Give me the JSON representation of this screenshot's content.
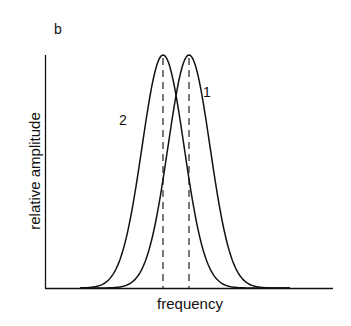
{
  "panel_label": "b",
  "chart_data": {
    "type": "line",
    "title": "",
    "xlabel": "frequency",
    "ylabel": "relative amplitude",
    "grid": false,
    "legend": "inline curve labels",
    "x_ticks": [],
    "y_ticks": [],
    "series": [
      {
        "name": "1",
        "shape": "gaussian",
        "center": 0.5,
        "peak": 1.0,
        "width_sigma": 0.073
      },
      {
        "name": "2",
        "shape": "gaussian",
        "center": 0.41,
        "peak": 1.0,
        "width_sigma": 0.073
      }
    ],
    "markers": [
      {
        "type": "dashed-vertical",
        "x": 0.41,
        "series": "2"
      },
      {
        "type": "dashed-vertical",
        "x": 0.5,
        "series": "1"
      }
    ],
    "annotations": [
      {
        "text": "1",
        "near": "right flank of curve 1"
      },
      {
        "text": "2",
        "near": "left flank of curve 2"
      }
    ],
    "xlim": [
      0,
      1
    ],
    "ylim": [
      0,
      1
    ]
  },
  "labels": {
    "curve1": "1",
    "curve2": "2",
    "xlabel": "frequency",
    "ylabel": "relative amplitude"
  }
}
